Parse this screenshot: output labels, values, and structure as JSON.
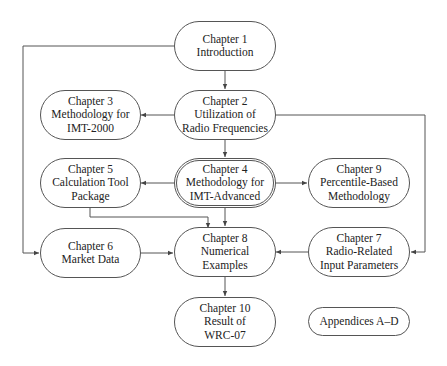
{
  "diagram": {
    "nodes": {
      "ch1": {
        "lines": [
          "Chapter 1",
          "Introduction"
        ]
      },
      "ch2": {
        "lines": [
          "Chapter 2",
          "Utilization of",
          "Radio Frequencies"
        ]
      },
      "ch3": {
        "lines": [
          "Chapter 3",
          "Methodology for",
          "IMT-2000"
        ]
      },
      "ch4": {
        "lines": [
          "Chapter 4",
          "Methodology for",
          "IMT-Advanced"
        ]
      },
      "ch5": {
        "lines": [
          "Chapter 5",
          "Calculation Tool",
          "Package"
        ]
      },
      "ch6": {
        "lines": [
          "Chapter 6",
          "Market Data"
        ]
      },
      "ch7": {
        "lines": [
          "Chapter 7",
          "Radio-Related",
          "Input Parameters"
        ]
      },
      "ch8": {
        "lines": [
          "Chapter 8",
          "Numerical",
          "Examples"
        ]
      },
      "ch9": {
        "lines": [
          "Chapter 9",
          "Percentile-Based",
          "Methodology"
        ]
      },
      "ch10": {
        "lines": [
          "Chapter 10",
          "Result of",
          "WRC-07"
        ]
      },
      "appendices": {
        "lines": [
          "Appendices A–D"
        ]
      }
    },
    "edges": [
      {
        "from": "Chapter 1",
        "to": "Chapter 2"
      },
      {
        "from": "Chapter 1",
        "to": "Chapter 6"
      },
      {
        "from": "Chapter 2",
        "to": "Chapter 3"
      },
      {
        "from": "Chapter 2",
        "to": "Chapter 4"
      },
      {
        "from": "Chapter 2",
        "to": "Chapter 7"
      },
      {
        "from": "Chapter 4",
        "to": "Chapter 5"
      },
      {
        "from": "Chapter 4",
        "to": "Chapter 9"
      },
      {
        "from": "Chapter 4",
        "to": "Chapter 8"
      },
      {
        "from": "Chapter 5",
        "to": "Chapter 8"
      },
      {
        "from": "Chapter 6",
        "to": "Chapter 8"
      },
      {
        "from": "Chapter 7",
        "to": "Chapter 8"
      },
      {
        "from": "Chapter 8",
        "to": "Chapter 10"
      }
    ],
    "colors": {
      "stroke": "#555555",
      "text": "#222222",
      "background": "#ffffff"
    }
  }
}
